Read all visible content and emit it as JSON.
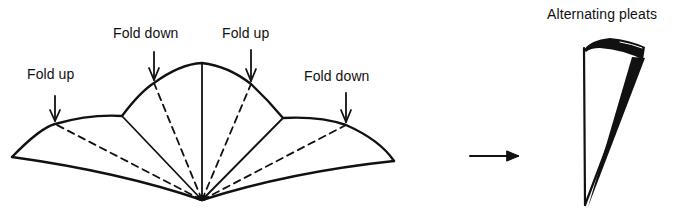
{
  "figure": {
    "labels": {
      "fold_up_left": "Fold up",
      "fold_down_center": "Fold down",
      "fold_up_center": "Fold up",
      "fold_down_right": "Fold down",
      "result_title": "Alternating pleats"
    },
    "colors": {
      "stroke": "#111111",
      "background": "#ffffff"
    },
    "fan": {
      "apex": [
        202,
        200
      ],
      "folds": [
        {
          "type": "solid",
          "role": "edge",
          "end": [
            12,
            157
          ]
        },
        {
          "type": "dashed",
          "role": "fold up",
          "end": [
            55,
            124
          ]
        },
        {
          "type": "solid",
          "role": "crease",
          "end": [
            122,
            116
          ]
        },
        {
          "type": "dashed",
          "role": "fold down",
          "end": [
            154,
            83
          ]
        },
        {
          "type": "solid",
          "role": "crease",
          "end": [
            202,
            63
          ]
        },
        {
          "type": "dashed",
          "role": "fold up",
          "end": [
            251,
            84
          ]
        },
        {
          "type": "solid",
          "role": "crease",
          "end": [
            283,
            118
          ]
        },
        {
          "type": "dashed",
          "role": "fold down",
          "end": [
            346,
            125
          ]
        },
        {
          "type": "solid",
          "role": "edge",
          "end": [
            394,
            161
          ]
        }
      ]
    },
    "transition_arrow": {
      "from": [
        470,
        156
      ],
      "to": [
        519,
        156
      ]
    }
  }
}
